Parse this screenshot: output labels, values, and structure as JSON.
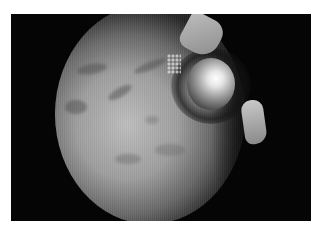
{
  "image": {
    "type": "endoscopic view (grayscale)",
    "description": "Circular endoscopic field of view on black background showing pale mucosal surface with dark streaks, a bright specular spherical structure upper-right, and instrument tips at top and right edge",
    "colors": {
      "border": "#ffffff",
      "background": "#050505",
      "tissue": "#b4b4b4",
      "highlight": "#ffffff",
      "shadow": "#1a1a1a"
    },
    "elements": [
      {
        "name": "scope-field",
        "shape": "circle"
      },
      {
        "name": "bright-spherical-structure",
        "position": "upper-right"
      },
      {
        "name": "instrument-tip-top",
        "position": "top-center-right"
      },
      {
        "name": "instrument-tip-right",
        "position": "right"
      },
      {
        "name": "dark-streaks",
        "position": "left and center"
      }
    ]
  }
}
